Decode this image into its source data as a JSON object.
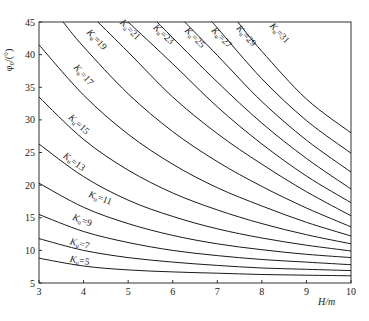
{
  "chart_data": {
    "type": "line",
    "title": "",
    "xlabel": "H/m",
    "ylabel": "φ₀/(°)",
    "xlim": [
      3,
      10
    ],
    "ylim": [
      5,
      45
    ],
    "xticks": [
      3,
      4,
      5,
      6,
      7,
      8,
      9,
      10
    ],
    "yticks": [
      5,
      10,
      15,
      20,
      25,
      30,
      35,
      40,
      45
    ],
    "grid": false,
    "legend": "inline curve labels",
    "series": [
      {
        "name": "Ku=5",
        "label": "5",
        "points": [
          [
            3,
            8.8
          ],
          [
            4,
            7.6
          ],
          [
            5,
            7.0
          ],
          [
            6,
            6.7
          ],
          [
            7,
            6.5
          ],
          [
            8,
            6.3
          ],
          [
            9,
            6.2
          ],
          [
            10,
            6.1
          ]
        ],
        "label_at": [
          3.9,
          8.0
        ]
      },
      {
        "name": "Ku=7",
        "label": "7",
        "points": [
          [
            3,
            11.8
          ],
          [
            4,
            10.0
          ],
          [
            5,
            8.9
          ],
          [
            6,
            8.2
          ],
          [
            7,
            7.7
          ],
          [
            8,
            7.3
          ],
          [
            9,
            7.1
          ],
          [
            10,
            6.9
          ]
        ],
        "label_at": [
          3.9,
          10.6
        ]
      },
      {
        "name": "Ku=9",
        "label": "9",
        "points": [
          [
            3,
            15.5
          ],
          [
            4,
            12.9
          ],
          [
            5,
            11.2
          ],
          [
            6,
            10.0
          ],
          [
            7,
            9.2
          ],
          [
            8,
            8.6
          ],
          [
            9,
            8.2
          ],
          [
            10,
            7.8
          ]
        ],
        "label_at": [
          3.95,
          14.2
        ]
      },
      {
        "name": "Ku=11",
        "label": "11",
        "points": [
          [
            3,
            20.3
          ],
          [
            4,
            16.6
          ],
          [
            5,
            14.1
          ],
          [
            6,
            12.3
          ],
          [
            7,
            11.0
          ],
          [
            8,
            10.1
          ],
          [
            9,
            9.4
          ],
          [
            10,
            8.9
          ]
        ],
        "label_at": [
          4.35,
          17.6
        ]
      },
      {
        "name": "Ku=13",
        "label": "13",
        "points": [
          [
            3,
            26.3
          ],
          [
            4,
            21.3
          ],
          [
            5,
            17.7
          ],
          [
            6,
            15.2
          ],
          [
            7,
            13.3
          ],
          [
            8,
            11.9
          ],
          [
            9,
            10.8
          ],
          [
            10,
            9.9
          ]
        ],
        "label_at": [
          3.75,
          23.2
        ]
      },
      {
        "name": "Ku=15",
        "label": "15",
        "points": [
          [
            3,
            33.5
          ],
          [
            4,
            27.0
          ],
          [
            5,
            22.3
          ],
          [
            6,
            18.8
          ],
          [
            7,
            16.2
          ],
          [
            8,
            14.1
          ],
          [
            9,
            12.4
          ],
          [
            10,
            11.0
          ]
        ],
        "label_at": [
          3.85,
          29.0
        ]
      },
      {
        "name": "Ku=17",
        "label": "17",
        "points": [
          [
            3,
            41.5
          ],
          [
            4,
            33.8
          ],
          [
            5,
            27.8
          ],
          [
            6,
            23.2
          ],
          [
            7,
            19.6
          ],
          [
            8,
            16.8
          ],
          [
            9,
            14.3
          ],
          [
            10,
            12.2
          ]
        ],
        "label_at": [
          3.95,
          36.6
        ]
      },
      {
        "name": "Ku=19",
        "label": "19",
        "points": [
          [
            3.54,
            45
          ],
          [
            4,
            41.2
          ],
          [
            5,
            34.0
          ],
          [
            6,
            28.2
          ],
          [
            7,
            23.6
          ],
          [
            8,
            19.8
          ],
          [
            9,
            16.5
          ],
          [
            10,
            13.6
          ]
        ],
        "label_at": [
          4.25,
          42.0
        ]
      },
      {
        "name": "Ku=21",
        "label": "21",
        "points": [
          [
            4.32,
            45
          ],
          [
            5,
            40.4
          ],
          [
            6,
            33.5
          ],
          [
            7,
            27.9
          ],
          [
            8,
            23.2
          ],
          [
            9,
            19.0
          ],
          [
            10,
            15.3
          ]
        ],
        "label_at": [
          5.0,
          43.5
        ]
      },
      {
        "name": "Ku=23",
        "label": "23",
        "points": [
          [
            5.0,
            45
          ],
          [
            6,
            38.6
          ],
          [
            7,
            32.0
          ],
          [
            8,
            26.3
          ],
          [
            9,
            21.4
          ],
          [
            10,
            17.3
          ]
        ],
        "label_at": [
          5.75,
          42.8
        ]
      },
      {
        "name": "Ku=25",
        "label": "25",
        "points": [
          [
            5.65,
            45
          ],
          [
            6,
            42.6
          ],
          [
            7,
            35.8
          ],
          [
            8,
            29.5
          ],
          [
            9,
            24.1
          ],
          [
            10,
            19.4
          ]
        ],
        "label_at": [
          6.45,
          42.3
        ]
      },
      {
        "name": "Ku=27",
        "label": "27",
        "points": [
          [
            6.27,
            45
          ],
          [
            7,
            39.9
          ],
          [
            8,
            32.8
          ],
          [
            9,
            26.9
          ],
          [
            10,
            22.0
          ]
        ],
        "label_at": [
          7.05,
          42.3
        ]
      },
      {
        "name": "Ku=29",
        "label": "29",
        "points": [
          [
            6.88,
            45
          ],
          [
            7,
            44.1
          ],
          [
            8,
            36.3
          ],
          [
            9,
            29.9
          ],
          [
            10,
            24.9
          ]
        ],
        "label_at": [
          7.6,
          42.6
        ]
      },
      {
        "name": "Ku=31",
        "label": "31",
        "points": [
          [
            7.46,
            45
          ],
          [
            8,
            40.5
          ],
          [
            9,
            33.2
          ],
          [
            10,
            28.0
          ]
        ],
        "label_at": [
          8.35,
          43.0
        ]
      }
    ]
  },
  "axes": {
    "xlabel_text": "H/m",
    "ylabel_text": "φ₀/(°)",
    "curve_label_prefix": "K",
    "curve_label_sub": "u",
    "curve_label_eq": "="
  }
}
